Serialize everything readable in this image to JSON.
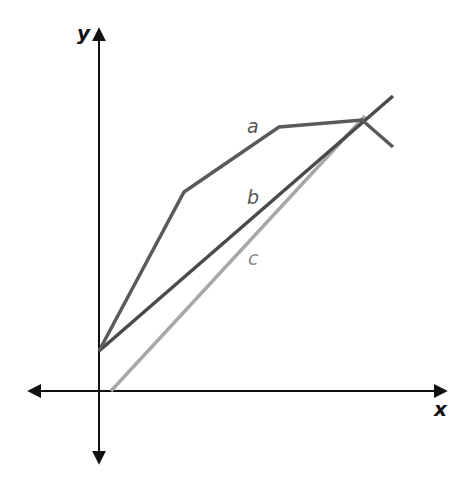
{
  "axes": {
    "x_label": "x",
    "y_label": "y",
    "color": "#111111"
  },
  "lines": [
    {
      "name": "a",
      "label": "a",
      "color": "#5a5a5a",
      "label_color": "#555555"
    },
    {
      "name": "b",
      "label": "b",
      "color": "#4a4a4a",
      "label_color": "#555555"
    },
    {
      "name": "c",
      "label": "c",
      "color": "#a8a8a8",
      "label_color": "#8a8a8a"
    }
  ]
}
